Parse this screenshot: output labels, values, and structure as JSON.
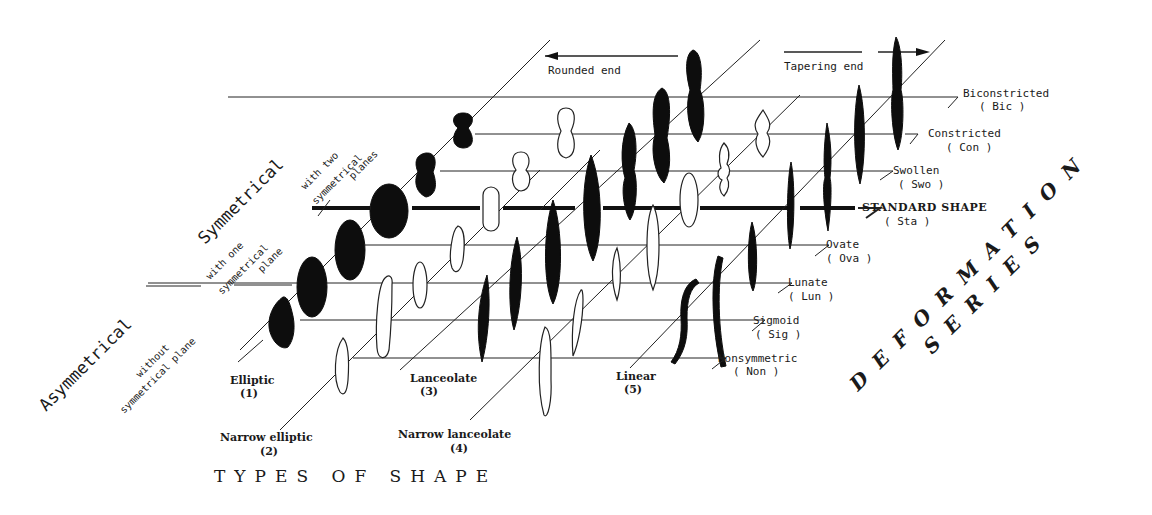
{
  "figure": {
    "type": "deformation-series-diagram",
    "x_axis_title": "TYPES OF SHAPE",
    "depth_axis_title_line1": "DEFORMATION",
    "depth_axis_title_line2": "SERIES",
    "direction_labels": {
      "rounded_end": "Rounded end",
      "tapering_end": "Tapering end"
    },
    "symmetry_groups": {
      "asymmetrical": {
        "title": "Asymmetrical",
        "subtitle_line1": "without",
        "subtitle_line2": "symmetrical plane"
      },
      "symmetrical": {
        "title": "Symmetrical",
        "one_plane_line1": "with one",
        "one_plane_line2": "symmetrical",
        "one_plane_line3": "plane",
        "two_plane_line1": "with two",
        "two_plane_line2": "symmetrical",
        "two_plane_line3": "planes"
      }
    },
    "shape_types": [
      {
        "name": "Elliptic",
        "code": "(1)"
      },
      {
        "name": "Narrow elliptic",
        "code": "(2)"
      },
      {
        "name": "Lanceolate",
        "code": "(3)"
      },
      {
        "name": "Narrow lanceolate",
        "code": "(4)"
      },
      {
        "name": "Linear",
        "code": "(5)"
      }
    ],
    "deformation_series": [
      {
        "name": "Biconstricted",
        "code": "( Bic )"
      },
      {
        "name": "Constricted",
        "code": "( Con )"
      },
      {
        "name": "Swollen",
        "code": "( Swo )"
      },
      {
        "name": "STANDARD SHAPE",
        "code": "( Sta )"
      },
      {
        "name": "Ovate",
        "code": "( Ova )"
      },
      {
        "name": "Lunate",
        "code": "( Lun )"
      },
      {
        "name": "Sigmoid",
        "code": "( Sig )"
      },
      {
        "name": "Nonsymmetric",
        "code": "( Non )"
      }
    ],
    "colors": {
      "ink": "#0d0d0d",
      "background": "#ffffff"
    }
  }
}
